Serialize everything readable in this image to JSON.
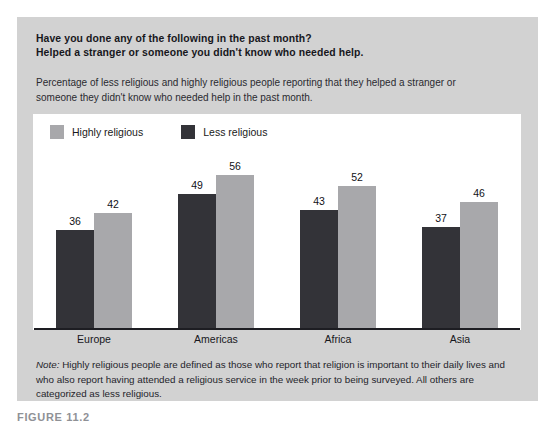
{
  "panel": {
    "headline_line1": "Have you done any of the following in the past month?",
    "headline_line2": "Helped a stranger or someone you didn't know who needed help.",
    "subhead": "Percentage of less religious and highly religious people reporting that they helped a stranger or someone they didn't know who needed help in the past month.",
    "note_label": "Note:",
    "note_text": " Highly religious people are defined as those who report that religion is important to their daily lives and who also report having attended a religious service in the week prior to being surveyed. All others are categorized as less religious.",
    "caption": "FIGURE 11.2"
  },
  "colors": {
    "panel_background": "#d2d2d2",
    "plot_background": "#ffffff",
    "highly_religious": "#a8a8ab",
    "less_religious": "#333338",
    "axis": "#1d1d22",
    "text": "#17171c"
  },
  "chart_data": {
    "type": "bar",
    "title": "Have you done any of the following in the past month? Helped a stranger or someone you didn't know who needed help.",
    "subtitle": "Percentage of less religious and highly religious people reporting that they helped a stranger or someone they didn't know who needed help in the past month.",
    "xlabel": "",
    "ylabel": "",
    "ylim": [
      0,
      78
    ],
    "grid": false,
    "legend_position": "top-left",
    "categories": [
      "Europe",
      "Americas",
      "Africa",
      "Asia"
    ],
    "series": [
      {
        "name": "Less religious",
        "color": "#333338",
        "order_in_group": 1,
        "values": [
          36,
          49,
          43,
          37
        ]
      },
      {
        "name": "Highly religious",
        "color": "#a8a8ab",
        "order_in_group": 2,
        "values": [
          42,
          56,
          52,
          46
        ]
      }
    ],
    "legend": [
      "Highly religious",
      "Less religious"
    ],
    "value_labels": [
      [
        "36",
        "42"
      ],
      [
        "49",
        "56"
      ],
      [
        "43",
        "52"
      ],
      [
        "37",
        "46"
      ]
    ]
  }
}
